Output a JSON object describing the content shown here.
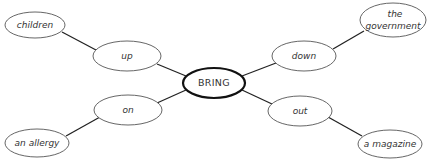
{
  "diagram": {
    "type": "mind-map",
    "center": {
      "label": "BRING"
    },
    "branches": [
      {
        "particle": "up",
        "object": "children"
      },
      {
        "particle": "down",
        "object": "the government",
        "object_lines": [
          "the",
          "government"
        ]
      },
      {
        "particle": "on",
        "object": "an allergy"
      },
      {
        "particle": "out",
        "object": "a magazine"
      }
    ]
  }
}
